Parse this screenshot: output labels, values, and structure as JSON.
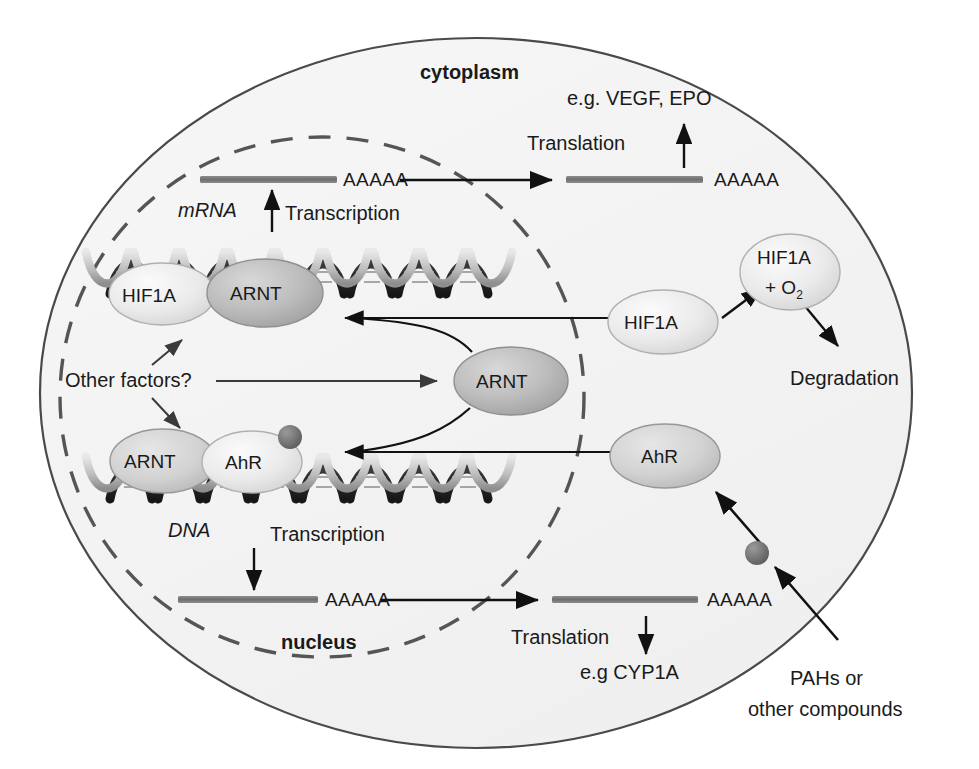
{
  "diagram": {
    "compartments": {
      "cytoplasm_label": "cytoplasm",
      "nucleus_label": "nucleus"
    },
    "colors": {
      "cell_fill": "#f3f3f3",
      "cell_stroke": "#4a4a4a",
      "nucleus_stroke": "#555555",
      "mrna_bar": "#7a7a7a",
      "arrow": "#111111",
      "ligand_dot": "#6b6b6b",
      "node_light": "#ececec",
      "node_mid": "#cfcfcf",
      "node_dark": "#b4b4b4",
      "helix_dark": "#2b2b2b",
      "helix_light": "#c9c9c9"
    },
    "nodes": [
      {
        "id": "hif1a-dna",
        "label": "HIF1A",
        "tone": "light"
      },
      {
        "id": "arnt-dna-top",
        "label": "ARNT",
        "tone": "dark"
      },
      {
        "id": "arnt-free",
        "label": "ARNT",
        "tone": "dark"
      },
      {
        "id": "arnt-dna-bot",
        "label": "ARNT",
        "tone": "mid"
      },
      {
        "id": "ahr-dna",
        "label": "AhR",
        "tone": "light"
      },
      {
        "id": "hif1a-cyto",
        "label": "HIF1A",
        "tone": "light"
      },
      {
        "id": "hif1a-o2",
        "label": "HIF1A",
        "label2": "+ O",
        "sub": "2",
        "tone": "light"
      },
      {
        "id": "ahr-cyto",
        "label": "AhR",
        "tone": "mid"
      }
    ],
    "labels": {
      "cytoplasm": "cytoplasm",
      "nucleus": "nucleus",
      "mrna": "mRNA",
      "dna": "DNA",
      "transcription_top": "Transcription",
      "transcription_bottom": "Transcription",
      "translation_top": "Translation",
      "translation_bottom": "Translation",
      "products_top": "e.g. VEGF, EPO",
      "products_bottom": "e.g CYP1A",
      "degradation": "Degradation",
      "other_factors": "Other factors?",
      "ligand_line1": "PAHs or",
      "ligand_line2": "other compounds",
      "polyA_nuclear_top": "AAAAA",
      "polyA_cyto_top": "AAAAA",
      "polyA_nuclear_bottom": "AAAAA",
      "polyA_cyto_bottom": "AAAAA"
    }
  }
}
